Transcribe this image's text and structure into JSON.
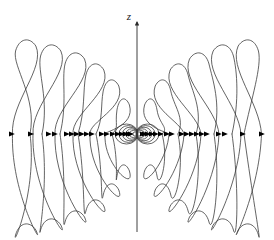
{
  "figure": {
    "title": "",
    "type": "oscillating-electric-dipole-field-lines",
    "width": 274,
    "height": 240,
    "background_color": "#ffffff",
    "line_color": "#3c3c3c",
    "axis_color": "#2a2a2a",
    "marker_color": "#000000",
    "line_width": 0.8
  },
  "axis": {
    "name": "z-axis",
    "label": "z",
    "label_x": 129,
    "label_y": 17,
    "x": 137,
    "top_y": 22,
    "bottom_y": 232,
    "arrow_direction": "up"
  },
  "origin": {
    "x": 137,
    "y": 134
  },
  "center_loops": {
    "description": "tiny concentric near-field loops at the origin",
    "count_per_side": 6,
    "radii_x": [
      2.2,
      4.0,
      5.8,
      7.6,
      9.4,
      11.4
    ],
    "radii_y": [
      2.0,
      3.6,
      5.2,
      6.8,
      8.4,
      10.0
    ]
  },
  "lobes": {
    "description": "nested teardrop field-line lobes, mirrored across the z-axis and across the horizontal midline",
    "count_per_quadrant": 6,
    "params": [
      {
        "tip_x": 27.0,
        "apex_y": 42.0,
        "waist_x": 12.5,
        "neck_x": 30.0,
        "width": 26.0
      },
      {
        "tip_x": 52.0,
        "apex_y": 47.0,
        "waist_x": 33.0,
        "neck_x": 42.0,
        "width": 26.0
      },
      {
        "tip_x": 76.0,
        "apex_y": 55.0,
        "waist_x": 55.0,
        "neck_x": 60.0,
        "width": 25.0
      },
      {
        "tip_x": 96.0,
        "apex_y": 66.0,
        "waist_x": 73.0,
        "neck_x": 78.0,
        "width": 23.0
      },
      {
        "tip_x": 112.0,
        "apex_y": 82.0,
        "waist_x": 90.0,
        "neck_x": 96.0,
        "width": 20.0
      },
      {
        "tip_x": 124.0,
        "apex_y": 101.0,
        "waist_x": 105.0,
        "neck_x": 112.0,
        "width": 16.0
      }
    ]
  },
  "midline_markers": {
    "description": "arrowheads marking field direction where lines cross the horizontal midline",
    "y": 134,
    "direction": "right",
    "x_positions_left": [
      12,
      31,
      49,
      55,
      67,
      72,
      77,
      82,
      87,
      92,
      102,
      107,
      113,
      118,
      122,
      126,
      129,
      131
    ],
    "x_positions_right": [
      143,
      145,
      148,
      152,
      156,
      161,
      167,
      172,
      182,
      187,
      192,
      197,
      202,
      207,
      219,
      225,
      243,
      262
    ]
  },
  "chart_data": {
    "type": "line",
    "title": "",
    "xlabel": "",
    "ylabel": "z",
    "legend": [],
    "grid": false,
    "series": [
      {
        "name": "near-field loops",
        "description": "6 concentric small loops at origin"
      },
      {
        "name": "radiation lobes",
        "description": "6 nested teardrop lobes per quadrant, 4 quadrants"
      },
      {
        "name": "direction markers",
        "description": "36 arrowheads along horizontal midline"
      }
    ]
  }
}
